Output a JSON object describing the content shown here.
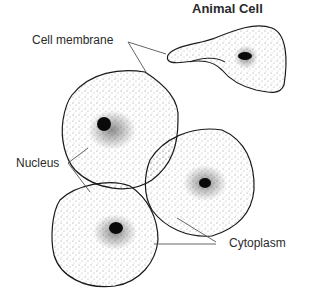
{
  "diagram": {
    "title": "Animal Cell",
    "labels": {
      "cell_membrane": "Cell membrane",
      "nucleus": "Nucleus",
      "cytoplasm": "Cytoplasm"
    },
    "cells": [
      {
        "id": "elongated-cell",
        "shape": "elongated"
      },
      {
        "id": "upper-left-cell",
        "shape": "polygonal"
      },
      {
        "id": "middle-right-cell",
        "shape": "rounded"
      },
      {
        "id": "lower-left-cell",
        "shape": "polygonal"
      }
    ],
    "colors": {
      "ink": "#1a1a1a",
      "stipple": "#333333",
      "nucleus": "#0a0a0a",
      "leader": "#555555"
    }
  }
}
